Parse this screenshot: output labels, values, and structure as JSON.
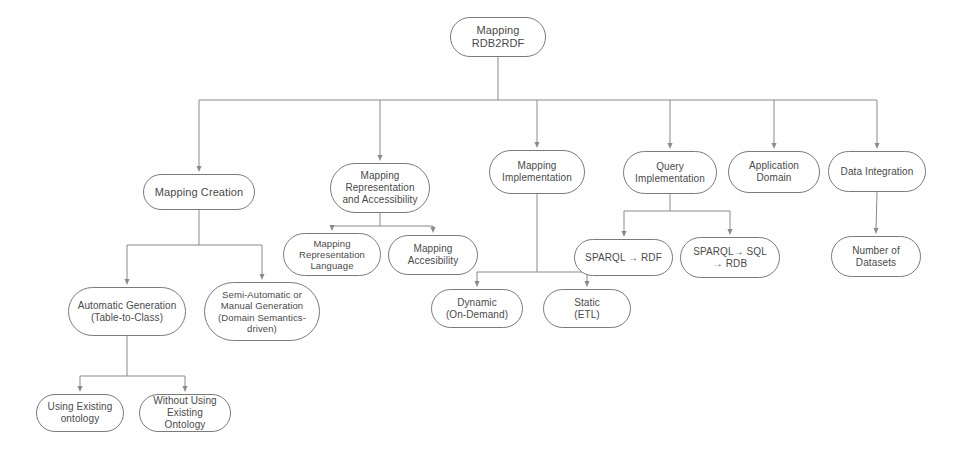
{
  "diagram": {
    "style": {
      "node_border_color": "#7a7a7a",
      "node_fill_color": "#ffffff",
      "edge_color": "#8a8a8a",
      "text_color": "#4a4a4a",
      "background_color": "#fefefe"
    },
    "nodes": [
      {
        "id": "root",
        "label": "Mapping\nRDB2RDF",
        "x": 450,
        "y": 17,
        "w": 96,
        "h": 40,
        "size": "s11"
      },
      {
        "id": "creation",
        "label": "Mapping Creation",
        "x": 143,
        "y": 174,
        "w": 112,
        "h": 36,
        "size": "s11"
      },
      {
        "id": "repaccess",
        "label": "Mapping\nRepresentation\nand Accessibility",
        "x": 330,
        "y": 163,
        "w": 100,
        "h": 50,
        "size": "s10"
      },
      {
        "id": "mapimpl",
        "label": "Mapping\nImplementation",
        "x": 489,
        "y": 150,
        "w": 96,
        "h": 44,
        "size": "s10"
      },
      {
        "id": "queryimpl",
        "label": "Query\nImplementation",
        "x": 623,
        "y": 151,
        "w": 94,
        "h": 43,
        "size": "s10"
      },
      {
        "id": "appdomain",
        "label": "Application\nDomain",
        "x": 728,
        "y": 151,
        "w": 92,
        "h": 42,
        "size": "s10"
      },
      {
        "id": "dataint",
        "label": "Data Integration",
        "x": 828,
        "y": 151,
        "w": 98,
        "h": 41,
        "size": "s10"
      },
      {
        "id": "replang",
        "label": "Mapping\nRepresentation\nLanguage",
        "x": 283,
        "y": 233,
        "w": 98,
        "h": 43,
        "size": "s9"
      },
      {
        "id": "accessib",
        "label": "Mapping\nAccesibility",
        "x": 388,
        "y": 235,
        "w": 90,
        "h": 40,
        "size": "s10"
      },
      {
        "id": "sparqlrdf",
        "label": "SPARQL → RDF",
        "x": 574,
        "y": 239,
        "w": 99,
        "h": 37,
        "size": "s10"
      },
      {
        "id": "sparqlsql",
        "label": "SPARQL→ SQL\n→ RDB",
        "x": 680,
        "y": 237,
        "w": 100,
        "h": 41,
        "size": "s10"
      },
      {
        "id": "numdatasets",
        "label": "Number of\nDatasets",
        "x": 831,
        "y": 236,
        "w": 90,
        "h": 41,
        "size": "s10"
      },
      {
        "id": "dynamic",
        "label": "Dynamic\n(On-Demand)",
        "x": 431,
        "y": 289,
        "w": 92,
        "h": 39,
        "size": "s10"
      },
      {
        "id": "static",
        "label": "Static\n(ETL)",
        "x": 543,
        "y": 289,
        "w": 88,
        "h": 39,
        "size": "s10"
      },
      {
        "id": "autogen",
        "label": "Automatic Generation\n(Table-to-Class)",
        "x": 68,
        "y": 287,
        "w": 118,
        "h": 49,
        "size": "s10"
      },
      {
        "id": "semiauto",
        "label": "Semi-Automatic or\nManual Generation\n(Domain Semantics-\ndriven)",
        "x": 204,
        "y": 282,
        "w": 116,
        "h": 59,
        "size": "s9"
      },
      {
        "id": "usingont",
        "label": "Using Existing\nontology",
        "x": 36,
        "y": 394,
        "w": 88,
        "h": 38,
        "size": "s10"
      },
      {
        "id": "withoutont",
        "label": "Without Using\nExisting Ontology",
        "x": 139,
        "y": 394,
        "w": 92,
        "h": 38,
        "size": "s10"
      }
    ],
    "edges": [
      {
        "from": "root",
        "to": "creation",
        "kind": "bus"
      },
      {
        "from": "root",
        "to": "repaccess",
        "kind": "bus"
      },
      {
        "from": "root",
        "to": "mapimpl",
        "kind": "bus"
      },
      {
        "from": "root",
        "to": "queryimpl",
        "kind": "bus"
      },
      {
        "from": "root",
        "to": "appdomain",
        "kind": "bus"
      },
      {
        "from": "root",
        "to": "dataint",
        "kind": "bus"
      },
      {
        "from": "creation",
        "to": "autogen",
        "kind": "bus"
      },
      {
        "from": "creation",
        "to": "semiauto",
        "kind": "bus"
      },
      {
        "from": "repaccess",
        "to": "replang",
        "kind": "bus"
      },
      {
        "from": "repaccess",
        "to": "accessib",
        "kind": "bus"
      },
      {
        "from": "mapimpl",
        "to": "dynamic",
        "kind": "bus"
      },
      {
        "from": "mapimpl",
        "to": "static",
        "kind": "bus"
      },
      {
        "from": "queryimpl",
        "to": "sparqlrdf",
        "kind": "bus"
      },
      {
        "from": "queryimpl",
        "to": "sparqlsql",
        "kind": "bus"
      },
      {
        "from": "dataint",
        "to": "numdatasets",
        "kind": "straight"
      },
      {
        "from": "autogen",
        "to": "usingont",
        "kind": "bus"
      },
      {
        "from": "autogen",
        "to": "withoutont",
        "kind": "bus"
      }
    ],
    "edge_routes": [
      {
        "name": "root-bus",
        "parent_bottom_y": 57,
        "bus_y": 100,
        "parent_cx": 498,
        "child_cxs": [
          199,
          380,
          537,
          670,
          774,
          877
        ],
        "child_top_y": [
          174,
          163,
          150,
          151,
          151,
          151
        ]
      },
      {
        "name": "creation-bus",
        "parent_bottom_y": 210,
        "bus_y": 245,
        "parent_cx": 199,
        "child_cxs": [
          127,
          262
        ],
        "child_top_y": [
          287,
          282
        ]
      },
      {
        "name": "repaccess-bus",
        "parent_bottom_y": 213,
        "bus_y": 226,
        "parent_cx": 380,
        "child_cxs": [
          332,
          433
        ],
        "child_top_y": [
          233,
          235
        ]
      },
      {
        "name": "mapimpl-bus",
        "parent_bottom_y": 194,
        "bus_y": 272,
        "parent_cx": 537,
        "child_cxs": [
          477,
          587
        ],
        "child_top_y": [
          289,
          289
        ]
      },
      {
        "name": "queryimpl-bus",
        "parent_bottom_y": 194,
        "bus_y": 211,
        "parent_cx": 670,
        "child_cxs": [
          624,
          730
        ],
        "child_top_y": [
          239,
          237
        ]
      },
      {
        "name": "dataint-line",
        "parent_bottom_y": 192,
        "bus_y": 0,
        "parent_cx": 877,
        "child_cxs": [
          876
        ],
        "child_top_y": [
          236
        ]
      },
      {
        "name": "autogen-bus",
        "parent_bottom_y": 336,
        "bus_y": 376,
        "parent_cx": 127,
        "child_cxs": [
          80,
          185
        ],
        "child_top_y": [
          394,
          394
        ]
      }
    ]
  }
}
